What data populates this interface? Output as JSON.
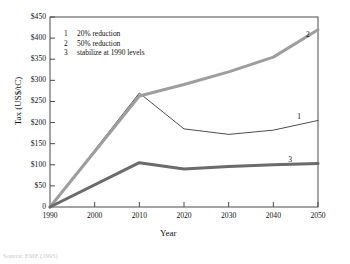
{
  "figure": {
    "caption": "Source: EMF (1993)"
  },
  "chart_data": {
    "type": "line",
    "title": "",
    "xlabel": "Year",
    "ylabel": "Tax (US$/tC)",
    "xlim": [
      1990,
      2050
    ],
    "ylim": [
      0,
      450
    ],
    "grid": false,
    "x_ticks": [
      "1990",
      "2000",
      "2010",
      "2020",
      "2030",
      "2040",
      "2050"
    ],
    "x_tick_values": [
      1990,
      2000,
      2010,
      2020,
      2030,
      2040,
      2050
    ],
    "y_ticks": [
      "$50",
      "$100",
      "$150",
      "$200",
      "$250",
      "$300",
      "$350",
      "$400",
      "$450"
    ],
    "y_tick_values": [
      50,
      100,
      150,
      200,
      250,
      300,
      350,
      400,
      450
    ],
    "origin_label": "0",
    "legend_position": "upper-left-inside",
    "x": [
      1990,
      2010,
      2020,
      2030,
      2040,
      2050
    ],
    "series": [
      {
        "name": "20% reduction",
        "key": "1",
        "color": "#4d4d4d",
        "width": 1.0,
        "values": [
          0,
          270,
          185,
          172,
          182,
          205
        ]
      },
      {
        "name": "50% reduction",
        "key": "2",
        "color": "#9e9e9e",
        "width": 3.0,
        "values": [
          0,
          263,
          290,
          320,
          355,
          420
        ]
      },
      {
        "name": "stabilize at 1990 levels",
        "key": "3",
        "color": "#6b6b6b",
        "width": 3.0,
        "values": [
          0,
          105,
          90,
          96,
          100,
          103
        ]
      }
    ],
    "legend": [
      {
        "num": "1",
        "label": "20% reduction"
      },
      {
        "num": "2",
        "label": "50% reduction"
      },
      {
        "num": "3",
        "label": "stabilize at 1990 levels"
      }
    ],
    "curve_end_labels": [
      {
        "num": "2",
        "x": 2048,
        "y": 408
      },
      {
        "num": "1",
        "x": 2046,
        "y": 212
      },
      {
        "num": "3",
        "x": 2044,
        "y": 112
      }
    ]
  }
}
